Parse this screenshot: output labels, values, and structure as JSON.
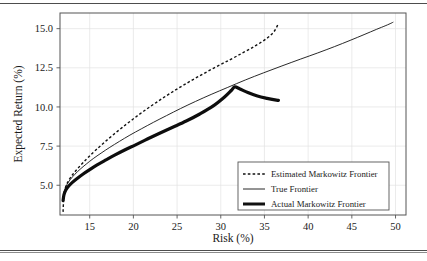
{
  "figure": {
    "background": "#ffffff",
    "frame_color": "#555555",
    "grid_color": "#e2e2e2",
    "top_rule": true,
    "bottom_rule": true
  },
  "chart_data": {
    "type": "line",
    "title": "",
    "xlabel": "Risk (%)",
    "ylabel": "Expected Return (%)",
    "xlim": [
      11.6,
      51.2
    ],
    "ylim": [
      3.1,
      16.0
    ],
    "xticks": [
      15,
      20,
      25,
      30,
      35,
      40,
      45,
      50
    ],
    "xticklabels": [
      "15",
      "20",
      "25",
      "30",
      "35",
      "40",
      "45",
      "50"
    ],
    "yticks": [
      5.0,
      7.5,
      10.0,
      12.5,
      15.0
    ],
    "yticklabels": [
      "5.0",
      "7.5",
      "10.0",
      "12.5",
      "15.0"
    ],
    "grid": true,
    "legend_position": "lower right",
    "series": [
      {
        "name": "Estimated Markowitz Frontier",
        "style": "dashed",
        "color": "#111111",
        "width": 1.4,
        "points": [
          [
            11.95,
            3.3
          ],
          [
            12.0,
            3.95
          ],
          [
            12.05,
            4.35
          ],
          [
            12.15,
            4.7
          ],
          [
            12.35,
            5.05
          ],
          [
            12.7,
            5.4
          ],
          [
            13.1,
            5.72
          ],
          [
            13.6,
            6.05
          ],
          [
            14.2,
            6.42
          ],
          [
            14.9,
            6.82
          ],
          [
            15.7,
            7.25
          ],
          [
            16.6,
            7.7
          ],
          [
            17.6,
            8.18
          ],
          [
            18.7,
            8.68
          ],
          [
            19.9,
            9.2
          ],
          [
            21.2,
            9.74
          ],
          [
            22.6,
            10.28
          ],
          [
            24.1,
            10.83
          ],
          [
            25.7,
            11.38
          ],
          [
            27.4,
            11.93
          ],
          [
            29.2,
            12.48
          ],
          [
            31.0,
            13.0
          ],
          [
            32.6,
            13.48
          ],
          [
            34.0,
            13.92
          ],
          [
            35.2,
            14.35
          ],
          [
            36.0,
            14.75
          ],
          [
            36.4,
            15.1
          ],
          [
            36.55,
            15.3
          ]
        ]
      },
      {
        "name": "True Frontier",
        "style": "solid",
        "color": "#111111",
        "width": 0.9,
        "points": [
          [
            11.9,
            3.95
          ],
          [
            12.0,
            4.35
          ],
          [
            12.15,
            4.72
          ],
          [
            12.4,
            5.05
          ],
          [
            12.8,
            5.38
          ],
          [
            13.3,
            5.7
          ],
          [
            13.9,
            6.02
          ],
          [
            14.6,
            6.35
          ],
          [
            15.4,
            6.7
          ],
          [
            16.3,
            7.05
          ],
          [
            17.3,
            7.42
          ],
          [
            18.4,
            7.8
          ],
          [
            19.6,
            8.2
          ],
          [
            20.9,
            8.6
          ],
          [
            22.3,
            9.02
          ],
          [
            23.8,
            9.45
          ],
          [
            25.4,
            9.9
          ],
          [
            27.1,
            10.35
          ],
          [
            28.9,
            10.8
          ],
          [
            30.8,
            11.25
          ],
          [
            32.8,
            11.72
          ],
          [
            34.9,
            12.18
          ],
          [
            37.0,
            12.62
          ],
          [
            39.1,
            13.05
          ],
          [
            41.1,
            13.45
          ],
          [
            43.0,
            13.85
          ],
          [
            44.8,
            14.25
          ],
          [
            46.4,
            14.62
          ],
          [
            47.8,
            14.95
          ],
          [
            48.9,
            15.2
          ],
          [
            49.5,
            15.35
          ],
          [
            49.75,
            15.42
          ]
        ]
      },
      {
        "name": "Actual Markowitz Frontier",
        "style": "solid-thick",
        "color": "#0d0d0d",
        "width": 3.2,
        "points": [
          [
            11.95,
            4.02
          ],
          [
            12.05,
            4.38
          ],
          [
            12.25,
            4.68
          ],
          [
            12.6,
            4.95
          ],
          [
            13.05,
            5.2
          ],
          [
            13.6,
            5.45
          ],
          [
            14.25,
            5.72
          ],
          [
            15.0,
            6.0
          ],
          [
            15.85,
            6.3
          ],
          [
            16.8,
            6.6
          ],
          [
            17.85,
            6.92
          ],
          [
            19.0,
            7.25
          ],
          [
            20.25,
            7.58
          ],
          [
            21.6,
            7.95
          ],
          [
            23.0,
            8.32
          ],
          [
            24.5,
            8.7
          ],
          [
            26.05,
            9.1
          ],
          [
            27.6,
            9.55
          ],
          [
            29.1,
            10.05
          ],
          [
            30.4,
            10.62
          ],
          [
            31.2,
            11.05
          ],
          [
            31.6,
            11.28
          ],
          [
            32.2,
            11.15
          ],
          [
            33.1,
            10.92
          ],
          [
            34.2,
            10.7
          ],
          [
            35.3,
            10.55
          ],
          [
            36.2,
            10.45
          ],
          [
            36.6,
            10.42
          ]
        ]
      }
    ]
  },
  "legend": {
    "items": [
      {
        "label": "Estimated Markowitz Frontier",
        "style": "dashed"
      },
      {
        "label": "True Frontier",
        "style": "solid"
      },
      {
        "label": "Actual Markowitz Frontier",
        "style": "solid-thick"
      }
    ]
  }
}
